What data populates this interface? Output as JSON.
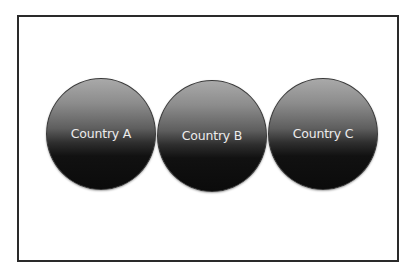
{
  "diagram": {
    "type": "three-circles-row",
    "colors": {
      "frame_border": "#2a2a2a",
      "circle_top": "#a9a9a9",
      "circle_bottom": "#0b0b0b",
      "label_text": "#ececec"
    },
    "circles": [
      {
        "label": "Country A"
      },
      {
        "label": "Country B"
      },
      {
        "label": "Country C"
      }
    ]
  }
}
